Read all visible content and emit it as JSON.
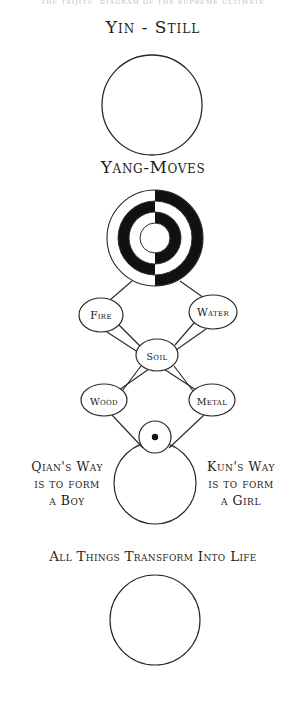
{
  "page": {
    "header_strip": "THE TAIJITU  DIAGRAM OF THE SUPREME ULTIMATE",
    "background_color": "#ffffff",
    "ink_color": "#2a2a2a",
    "width": 306,
    "height": 714
  },
  "labels": {
    "yin_still": "Yin - Still",
    "yang_moves": "Yang-Moves",
    "qian_way": "Qian's Way\nis to form\na Boy",
    "kun_way": "Kun's Way\nis to form\na Girl",
    "all_things": "All Things Transform Into Life"
  },
  "figures": {
    "top_circle": {
      "name": "yin-still-circle",
      "cx": 152,
      "cy": 105,
      "r": 50,
      "fill": "#ffffff"
    },
    "taiji": {
      "name": "taiji-rings",
      "cx": 155,
      "cy": 238,
      "radii": [
        48,
        37,
        26,
        15
      ],
      "left_half_fills": [
        "#ffffff",
        "#111111",
        "#ffffff",
        "#ffffff"
      ],
      "right_half_fills": [
        "#111111",
        "#ffffff",
        "#111111",
        "#ffffff"
      ]
    },
    "dot_circle": {
      "name": "seed-circle",
      "cx": 155,
      "cy": 437,
      "r": 16,
      "dot_r": 3.2,
      "dot_color": "#111111"
    },
    "lower_circle": {
      "name": "qian-kun-circle",
      "cx": 155,
      "cy": 483,
      "r": 41,
      "fill": "#ffffff"
    },
    "bottom_circle": {
      "name": "transform-circle",
      "cx": 155,
      "cy": 620,
      "r": 45,
      "fill": "#ffffff"
    }
  },
  "five_elements": {
    "nodes": [
      {
        "id": "fire",
        "label": "Fire",
        "cx": 101,
        "cy": 315,
        "rx": 22,
        "ry": 17
      },
      {
        "id": "water",
        "label": "Water",
        "cx": 213,
        "cy": 312,
        "rx": 24,
        "ry": 17
      },
      {
        "id": "soil",
        "label": "Soil",
        "cx": 157,
        "cy": 355,
        "rx": 21,
        "ry": 16
      },
      {
        "id": "wood",
        "label": "Wood",
        "cx": 104,
        "cy": 400,
        "rx": 23,
        "ry": 16
      },
      {
        "id": "metal",
        "label": "Metal",
        "cx": 212,
        "cy": 400,
        "rx": 23,
        "ry": 16
      }
    ],
    "links": [
      {
        "from": "taiji",
        "to": "fire"
      },
      {
        "from": "taiji",
        "to": "water"
      },
      {
        "from": "fire",
        "to": "soil"
      },
      {
        "from": "water",
        "to": "soil"
      },
      {
        "from": "wood",
        "to": "soil"
      },
      {
        "from": "metal",
        "to": "soil"
      },
      {
        "from": "fire",
        "to": "metal"
      },
      {
        "from": "water",
        "to": "wood"
      },
      {
        "from": "wood",
        "to": "seed"
      },
      {
        "from": "metal",
        "to": "seed"
      }
    ]
  }
}
